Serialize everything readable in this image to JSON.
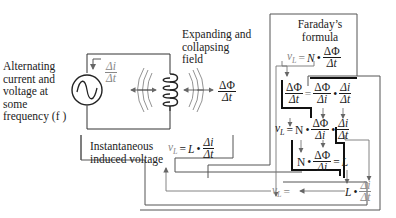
{
  "labels": {
    "source": [
      "Alternating",
      "current and",
      "voltage at",
      "some",
      "frequency (f )"
    ],
    "field": [
      "Expanding and",
      "collapsing",
      "field"
    ],
    "faraday": [
      "Faraday’s",
      "formula"
    ],
    "instantaneous": [
      "Instantaneous",
      "induced voltage"
    ]
  },
  "symbols": {
    "delta_i": "Δi",
    "delta_t": "Δt",
    "delta_phi": "ΔΦ",
    "vL": "v",
    "vL_sub": "L",
    "N": "N",
    "N_italic": "N",
    "L": "L",
    "dot": "•",
    "equals": "="
  },
  "equations": {
    "inductor_law": "vL = L • Δi/Δt",
    "faraday": "vL = N • ΔΦ/Δt",
    "chain_rule": "ΔΦ/Δt = ΔΦ/Δi • Δi/Δt",
    "substituted": "vL = N • ΔΦ/Δi • Δi/Δt",
    "inductance": "N • ΔΦ/Δi = L",
    "result": "vL = L • Δi/Δt"
  }
}
